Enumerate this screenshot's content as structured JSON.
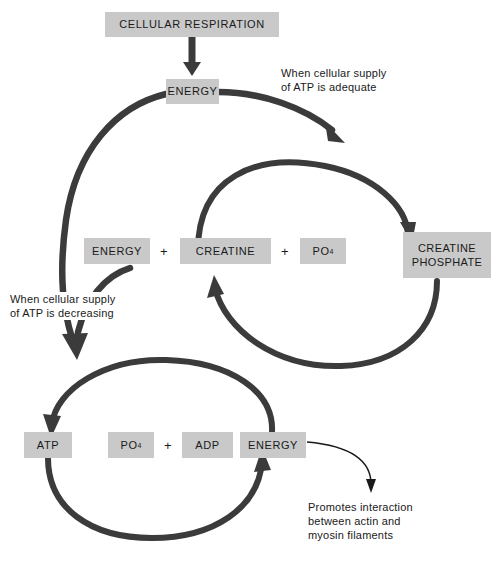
{
  "diagram": {
    "colors": {
      "box_fill": "#c9c9c9",
      "arrow": "#3b3b3b",
      "text": "#1a1a1a",
      "background": "#ffffff"
    },
    "boxes": {
      "cellular_respiration": "CELLULAR RESPIRATION",
      "energy_top": "ENERGY",
      "energy_mid": "ENERGY",
      "creatine": "CREATINE",
      "po4_mid": "PO",
      "po4_mid_sub": "4",
      "creatine_phosphate_line1": "CREATINE",
      "creatine_phosphate_line2": "PHOSPHATE",
      "atp": "ATP",
      "po4_bottom": "PO",
      "po4_bottom_sub": "4",
      "adp": "ADP",
      "energy_bottom": "ENERGY"
    },
    "operators": {
      "plus_mid_1": "+",
      "plus_mid_2": "+",
      "plus_bottom_1": "+",
      "plus_bottom_2": "+"
    },
    "notes": {
      "adequate": "When cellular supply\nof ATP is adequate",
      "decreasing": "When cellular supply\nof ATP is decreasing",
      "promotes": "Promotes interaction\nbetween actin and\nmyosin filaments"
    },
    "icons": {
      "arrow_respiration_to_energy": "down-arrow-icon",
      "arrow_energy_to_creatine_cycle": "curved-arrow-icon",
      "arrow_creatine_to_phosphate": "circular-arrow-icon",
      "arrow_phosphate_to_creatine": "circular-arrow-icon",
      "arrow_energy_to_atp_cycle": "curved-arrow-icon",
      "arrow_atp_to_energy": "circular-arrow-icon",
      "arrow_energy_to_atp": "circular-arrow-icon",
      "arrow_energy_to_promotes": "thin-curved-arrow-icon"
    }
  }
}
